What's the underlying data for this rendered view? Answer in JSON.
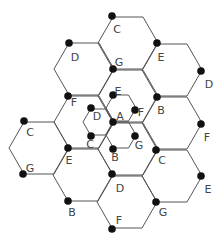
{
  "diagram": {
    "colors": {
      "line": "#555555",
      "dot": "#111111",
      "label": "#444444",
      "background": "#ffffff"
    },
    "large_hex_side": 30,
    "small_hex_side": 15,
    "large_hexes": [
      {
        "cx": 39,
        "cy": 148
      },
      {
        "cx": 84,
        "cy": 69
      },
      {
        "cx": 84,
        "cy": 122
      },
      {
        "cx": 83,
        "cy": 175
      },
      {
        "cx": 128,
        "cy": 43
      },
      {
        "cx": 128,
        "cy": 96
      },
      {
        "cx": 128,
        "cy": 149
      },
      {
        "cx": 127,
        "cy": 202
      },
      {
        "cx": 172,
        "cy": 70
      },
      {
        "cx": 172,
        "cy": 123
      },
      {
        "cx": 172,
        "cy": 176
      }
    ],
    "small_hexes": [
      {
        "cx": 121,
        "cy": 108
      },
      {
        "cx": 98,
        "cy": 122
      },
      {
        "cx": 121,
        "cy": 135
      }
    ],
    "nodes": [
      {
        "label": "C",
        "x": 112,
        "y": 16,
        "lx": 117,
        "ly": 29
      },
      {
        "label": "D",
        "x": 69,
        "y": 43,
        "lx": 75,
        "ly": 57
      },
      {
        "label": "G",
        "x": 113,
        "y": 69,
        "lx": 119,
        "ly": 62
      },
      {
        "label": "E",
        "x": 157,
        "y": 43,
        "lx": 161,
        "ly": 57
      },
      {
        "label": "D",
        "x": 201,
        "y": 71,
        "lx": 209,
        "ly": 84
      },
      {
        "label": "F",
        "x": 68,
        "y": 96,
        "lx": 74,
        "ly": 102
      },
      {
        "label": "B",
        "x": 157,
        "y": 97,
        "lx": 161,
        "ly": 110
      },
      {
        "label": "F",
        "x": 201,
        "y": 124,
        "lx": 207,
        "ly": 137
      },
      {
        "label": "C",
        "x": 24,
        "y": 121,
        "lx": 30,
        "ly": 132
      },
      {
        "label": "G",
        "x": 23,
        "y": 174,
        "lx": 30,
        "ly": 168
      },
      {
        "label": "E",
        "x": 68,
        "y": 148,
        "lx": 69,
        "ly": 160
      },
      {
        "label": "C",
        "x": 156,
        "y": 150,
        "lx": 162,
        "ly": 160
      },
      {
        "label": "E",
        "x": 201,
        "y": 176,
        "lx": 208,
        "ly": 189
      },
      {
        "label": "D",
        "x": 112,
        "y": 174,
        "lx": 120,
        "ly": 188
      },
      {
        "label": "B",
        "x": 68,
        "y": 201,
        "lx": 72,
        "ly": 212
      },
      {
        "label": "G",
        "x": 156,
        "y": 202,
        "lx": 163,
        "ly": 212
      },
      {
        "label": "F",
        "x": 112,
        "y": 229,
        "lx": 119,
        "ly": 220
      },
      {
        "label": "A",
        "x": 113,
        "y": 122,
        "lx": 120,
        "ly": 116
      },
      {
        "label": "E",
        "x": 113,
        "y": 95,
        "lx": 118,
        "ly": 91
      },
      {
        "label": "F",
        "x": 135,
        "y": 110,
        "lx": 141,
        "ly": 112
      },
      {
        "label": "D",
        "x": 91,
        "y": 108,
        "lx": 97,
        "ly": 116
      },
      {
        "label": "C",
        "x": 91,
        "y": 136,
        "lx": 90,
        "ly": 144
      },
      {
        "label": "G",
        "x": 135,
        "y": 136,
        "lx": 139,
        "ly": 145
      },
      {
        "label": "B",
        "x": 113,
        "y": 149,
        "lx": 115,
        "ly": 157
      }
    ]
  }
}
